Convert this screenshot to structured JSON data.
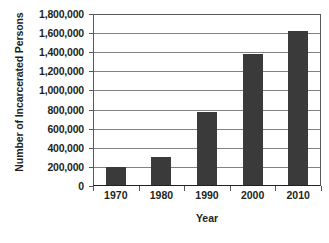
{
  "chart_data": {
    "type": "bar",
    "title": "",
    "subtitle": "",
    "xlabel": "Year",
    "ylabel": "Number of Incarcerated Persons",
    "categories": [
      "1970",
      "1980",
      "1990",
      "2000",
      "2010"
    ],
    "values": [
      200000,
      300000,
      770000,
      1380000,
      1620000
    ],
    "series": [
      {
        "name": "Incarcerated Persons",
        "values": [
          200000,
          300000,
          770000,
          1380000,
          1620000
        ]
      }
    ],
    "ylim": [
      0,
      1800000
    ],
    "ytick_step": 200000,
    "ytick_labels": [
      "1,800,000",
      "1,600,000",
      "1,400,000",
      "1,200,000",
      "1,000,000",
      "800,000",
      "600,000",
      "400,000",
      "200,000",
      "0"
    ],
    "ytick_values": [
      1800000,
      1600000,
      1400000,
      1200000,
      1000000,
      800000,
      600000,
      400000,
      200000,
      0
    ],
    "grid": true,
    "grid_axis": "y",
    "legend": false,
    "legend_position": "none",
    "bar_color": "#3a3a3a",
    "gridline_color": "#808285",
    "axis_color": "#58595b",
    "background_color": "#ffffff",
    "text_color": "#231f20"
  }
}
